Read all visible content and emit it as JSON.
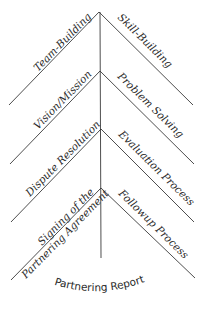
{
  "diagram": {
    "title": "Partnering Report",
    "chevrons": [
      {
        "left": "Team-Building",
        "right": "Skill-Building"
      },
      {
        "left": "Vision/Mission",
        "right": "Problem Solving"
      },
      {
        "left": "Dispute Resolution",
        "right": "Evaluation Process"
      },
      {
        "left_line1": "Signing of the",
        "left_line2": "Partnering Agreement",
        "right": "Followup Process"
      }
    ],
    "colors": {
      "line": "#3a3a3a",
      "text": "#2a2a2a",
      "background": "#ffffff"
    }
  }
}
